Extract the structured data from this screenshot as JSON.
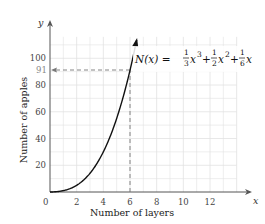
{
  "chart_data": {
    "type": "line",
    "title": "",
    "xlabel": "Number of layers",
    "ylabel": "Number of apples",
    "x_axis_var": "x",
    "y_axis_var": "y",
    "xlim": [
      0,
      14
    ],
    "ylim": [
      0,
      120
    ],
    "x_ticks": [
      0,
      2,
      4,
      6,
      8,
      10,
      12
    ],
    "y_ticks": [
      20,
      40,
      60,
      80,
      91,
      100
    ],
    "grid": true,
    "series": [
      {
        "name": "N(x) = 1/3 x^3 + 1/2 x^2 + 1/6 x",
        "x": [
          0,
          1,
          2,
          3,
          4,
          5,
          6,
          6.5
        ],
        "values": [
          0,
          1,
          5,
          14,
          30,
          55,
          91,
          114.3
        ]
      }
    ],
    "annotations": [
      {
        "type": "dashed-line",
        "from": [
          6,
          0
        ],
        "to": [
          6,
          91
        ],
        "label": "x = 6"
      },
      {
        "type": "dashed-arrow",
        "from": [
          6,
          91
        ],
        "to": [
          0,
          91
        ],
        "label": "91"
      },
      {
        "type": "equation",
        "text": "N(x) = 1/3 x^3 + 1/2 x^2 + 1/6 x"
      }
    ]
  },
  "labels": {
    "xlabel": "Number of layers",
    "ylabel": "Number of apples",
    "x_var": "x",
    "y_var": "y",
    "origin": "0",
    "highlight_y": "91",
    "xticks": [
      "2",
      "4",
      "6",
      "8",
      "10",
      "12"
    ],
    "yticks": [
      "20",
      "40",
      "60",
      "80",
      "100"
    ],
    "equation": {
      "lhs": "N(x) = ",
      "t1_num": "1",
      "t1_den": "3",
      "t1_var": "x",
      "t1_exp": "3",
      "plus1": "+",
      "t2_num": "1",
      "t2_den": "2",
      "t2_var": "x",
      "t2_exp": "2",
      "plus2": "+",
      "t3_num": "1",
      "t3_den": "6",
      "t3_var": "x"
    }
  },
  "colors": {
    "curve": "#111111",
    "grid": "#e2e2e2",
    "axis": "#555555",
    "dash": "#777777"
  }
}
